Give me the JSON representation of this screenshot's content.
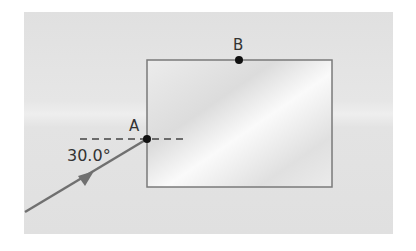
{
  "diagram": {
    "type": "refraction-block",
    "points": {
      "A": {
        "label": "A"
      },
      "B": {
        "label": "B"
      }
    },
    "angle_label": "30.0°",
    "colors": {
      "background": "#e2e2e2",
      "block_fill": "#f2f2f2",
      "block_stroke": "#7a7a7a",
      "ray": "#707070",
      "point": "#111111",
      "dashed": "#444444"
    }
  }
}
